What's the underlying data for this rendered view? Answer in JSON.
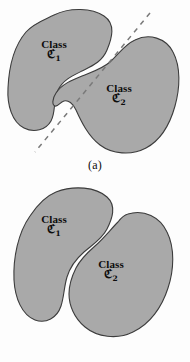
{
  "figure": {
    "colors": {
      "region_fill": "#a9a9a9",
      "region_stroke": "#3c3c3c",
      "boundary_line": "#7a7a7a",
      "background": "#fdfdfd",
      "text": "#0d0d0d"
    },
    "panels": [
      {
        "id": "a",
        "caption": "(a)",
        "separable": "linearly-separable",
        "boundary": {
          "type": "dashed-line",
          "x1": 150,
          "y1": 13,
          "x2": 35,
          "y2": 152
        },
        "regions": [
          {
            "id": "class-1",
            "word": "Class",
            "symbol": "ℭ",
            "subscript": "1"
          },
          {
            "id": "class-2",
            "word": "Class",
            "symbol": "ℭ",
            "subscript": "2"
          }
        ]
      },
      {
        "id": "b",
        "caption": "(b)",
        "separable": "non-linearly-separable",
        "boundary": {
          "type": "none"
        },
        "regions": [
          {
            "id": "class-1",
            "word": "Class",
            "symbol": "ℭ",
            "subscript": "1"
          },
          {
            "id": "class-2",
            "word": "Class",
            "symbol": "ℭ",
            "subscript": "2"
          }
        ]
      }
    ]
  }
}
